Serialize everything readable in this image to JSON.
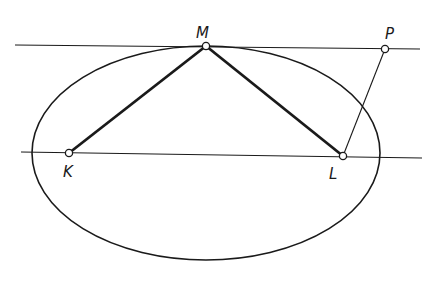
{
  "diagram": {
    "colors": {
      "stroke": "#1a1a1a",
      "background": "#ffffff"
    },
    "ellipse": {
      "cx": 206,
      "cy": 153,
      "rx": 174,
      "ry": 107
    },
    "lines": {
      "upper_tangent": {
        "x1": 15,
        "y1": 45,
        "x2": 420,
        "y2": 49
      },
      "lower_line": {
        "x1": 21,
        "y1": 152,
        "x2": 422,
        "y2": 158
      }
    },
    "segments": {
      "KM": {
        "x1": 69,
        "y1": 153,
        "x2": 206,
        "y2": 46
      },
      "ML": {
        "x1": 206,
        "y1": 46,
        "x2": 343,
        "y2": 156
      },
      "LP": {
        "x1": 343,
        "y1": 156,
        "x2": 385,
        "y2": 49
      }
    },
    "points": [
      {
        "name": "M",
        "x": 206,
        "y": 46,
        "label_x": 196,
        "label_y": 38
      },
      {
        "name": "P",
        "x": 385,
        "y": 49,
        "label_x": 385,
        "label_y": 39
      },
      {
        "name": "K",
        "x": 69,
        "y": 153,
        "label_x": 63,
        "label_y": 177
      },
      {
        "name": "L",
        "x": 343,
        "y": 156,
        "label_x": 329,
        "label_y": 179
      }
    ]
  }
}
